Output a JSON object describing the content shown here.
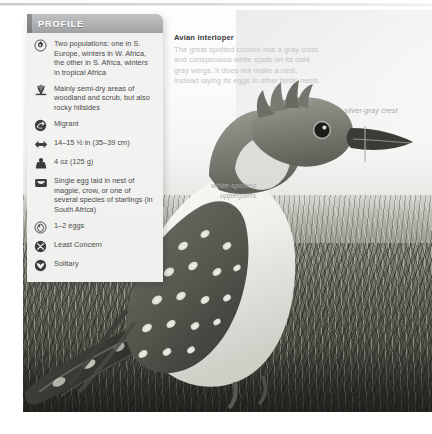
{
  "panel": {
    "title": "PROFILE",
    "rows": [
      {
        "icon": "distribution-icon",
        "text": "Two populations: one in S. Europe, winters in W. Africa, the other in S. Africa, winters in tropical Africa"
      },
      {
        "icon": "habitat-grass-icon",
        "text": "Mainly semi-dry areas of woodland and scrub, but also rocky hillsides"
      },
      {
        "icon": "migration-icon",
        "text": "Migrant"
      },
      {
        "icon": "length-arrows-icon",
        "text": "14–15 ½ in (35–39 cm)"
      },
      {
        "icon": "weight-icon",
        "text": "4 oz (125 g)"
      },
      {
        "icon": "nest-icon",
        "text": "Single egg laid in nest of magpie, crow, or one of several species of starlings (in South Africa)"
      },
      {
        "icon": "egg-icon",
        "text": "1–2 eggs"
      },
      {
        "icon": "conservation-status-icon",
        "text": "Least Concern"
      },
      {
        "icon": "social-solitary-icon",
        "text": "Solitary"
      }
    ]
  },
  "caption": {
    "title": "Avian interloper",
    "body": "The great spotted cuckoo has a gray crest and conspicuous white spots on its dark gray wings. It does not make a nest, instead laying its eggs in other birds’ nests."
  },
  "annotations": [
    {
      "name": "crest-label",
      "text": "silver-gray crest"
    },
    {
      "name": "upperparts-label",
      "line1": "white-spotted",
      "line2": "upperparts"
    }
  ],
  "colors": {
    "panel_header": "#b0b2b3",
    "panel_body": "#f1f1ef",
    "body_text": "#4a4b4c",
    "caption_title": "#3a3b3c",
    "caption_body": "#c2c3c4",
    "annotation_text": "#a8a9aa"
  }
}
